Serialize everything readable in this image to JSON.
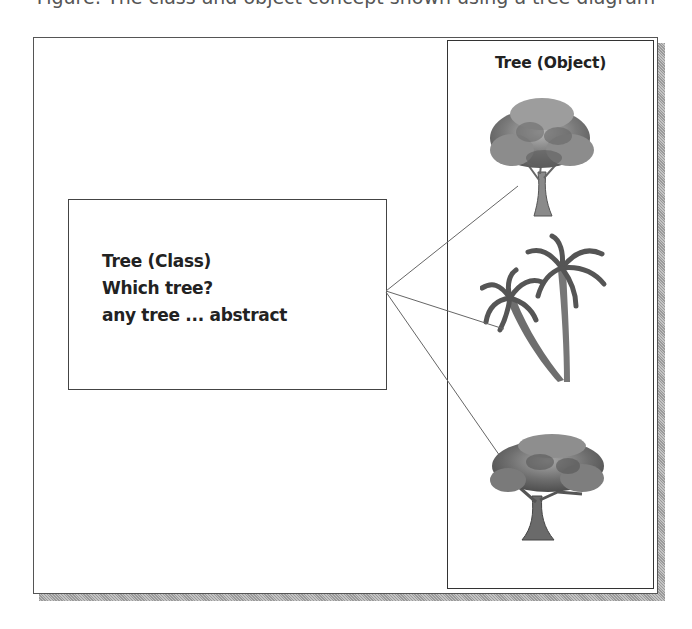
{
  "caption_cropped": "Figure: The class and object concept shown using a tree diagram",
  "class_box": {
    "lines": [
      "Tree (Class)",
      "Which tree?",
      "any tree ... abstract"
    ]
  },
  "object_panel": {
    "title": "Tree (Object)",
    "objects": [
      {
        "icon": "oak-tree-icon",
        "label": "broadleaf tree"
      },
      {
        "icon": "palm-tree-icon",
        "label": "palm trees"
      },
      {
        "icon": "acacia-tree-icon",
        "label": "spreading tree"
      }
    ]
  },
  "connectors": [
    {
      "from": [
        386,
        291
      ],
      "to": [
        518,
        186
      ]
    },
    {
      "from": [
        386,
        291
      ],
      "to": [
        504,
        329
      ]
    },
    {
      "from": [
        386,
        292
      ],
      "to": [
        502,
        459
      ]
    }
  ],
  "colors": {
    "border": "#444444",
    "text": "#222222",
    "shadow": "#a8a8a8",
    "connector": "#666666"
  }
}
